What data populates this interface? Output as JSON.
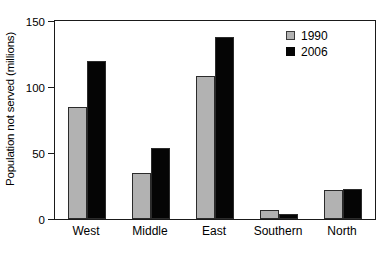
{
  "chart_data": {
    "type": "bar",
    "title": "",
    "xlabel": "",
    "ylabel": "Population not served  (millions)",
    "ylim": [
      0,
      150
    ],
    "yticks": [
      0,
      50,
      100,
      150
    ],
    "ytick_labels": [
      "0",
      "50",
      "100",
      "150"
    ],
    "grid": false,
    "legend_position": "top-right",
    "categories": [
      "West",
      "Middle",
      "East",
      "Southern",
      "North"
    ],
    "series": [
      {
        "name": "1990",
        "color": "#b2b2b2",
        "values": [
          85,
          35,
          108,
          7,
          22
        ]
      },
      {
        "name": "2006",
        "color": "#050505",
        "values": [
          120,
          54,
          138,
          4,
          23
        ]
      }
    ]
  },
  "legend": {
    "entries": [
      {
        "label": "1990"
      },
      {
        "label": "2006"
      }
    ]
  },
  "axes": {
    "y_title": "Population not served  (millions)"
  }
}
